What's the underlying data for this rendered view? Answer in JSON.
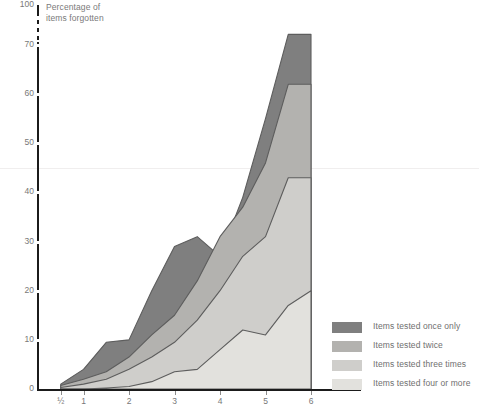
{
  "chart_data": {
    "type": "area",
    "title": "",
    "ylabel": "Percentage of items forgotten",
    "xlabel": "",
    "stacked": true,
    "grid": false,
    "legend_position": "bottom-right",
    "axis_break": {
      "between": [
        70,
        100
      ],
      "style": "dashed"
    },
    "ylim": [
      0,
      100
    ],
    "ytick_labels": [
      "0",
      "10",
      "20",
      "30",
      "40",
      "50",
      "60",
      "70",
      "100"
    ],
    "ytick_values": [
      0,
      10,
      20,
      30,
      40,
      50,
      60,
      70,
      100
    ],
    "xtick_labels": [
      "½",
      "1",
      "2",
      "3",
      "4",
      "5",
      "6"
    ],
    "xtick_values": [
      0.5,
      1,
      2,
      3,
      4,
      5,
      6
    ],
    "x": [
      0.5,
      1,
      1.5,
      2,
      2.5,
      3,
      3.5,
      4,
      4.5,
      5,
      5.5,
      6
    ],
    "series": [
      {
        "name": "Items tested four or more",
        "color": "#e2e1dd",
        "values": [
          0,
          0,
          0.2,
          0.5,
          1.5,
          3.5,
          4.0,
          8.0,
          12.0,
          11.0,
          17.0,
          20.0
        ]
      },
      {
        "name": "Items tested three times",
        "color": "#cfcecb",
        "values": [
          0.3,
          1.0,
          2.0,
          4.0,
          6.5,
          9.5,
          14.0,
          20.0,
          27.0,
          31.0,
          43.0,
          43.0
        ]
      },
      {
        "name": "Items tested twice",
        "color": "#b3b2af",
        "values": [
          0.7,
          2.0,
          3.5,
          6.5,
          11.0,
          15.0,
          22.0,
          31.0,
          37.0,
          46.0,
          62.0,
          62.0
        ]
      },
      {
        "name": "Items tested once only",
        "color": "#7f7f7f",
        "values": [
          1.0,
          4.0,
          9.5,
          10.0,
          20.0,
          29.0,
          31.0,
          27.0,
          39.0,
          55.0,
          78.0,
          78.0
        ]
      }
    ],
    "legend_entries": [
      {
        "label": "Items tested once only",
        "color": "#7f7f7f"
      },
      {
        "label": "Items tested twice",
        "color": "#b3b2af"
      },
      {
        "label": "Items tested three times",
        "color": "#cfcecb"
      },
      {
        "label": "Items tested four or more",
        "color": "#e2e1dd"
      }
    ]
  },
  "axis": {
    "title_line1": "Percentage of",
    "title_line2": "items forgotten",
    "y_labels": [
      "100",
      "70",
      "60",
      "50",
      "40",
      "30",
      "20",
      "10",
      "0"
    ],
    "x_labels": [
      "½",
      "1",
      "2",
      "3",
      "4",
      "5",
      "6"
    ]
  },
  "legend": {
    "items": [
      {
        "label": "Items tested once only"
      },
      {
        "label": "Items tested twice"
      },
      {
        "label": "Items tested three times"
      },
      {
        "label": "Items tested four or more"
      }
    ]
  }
}
